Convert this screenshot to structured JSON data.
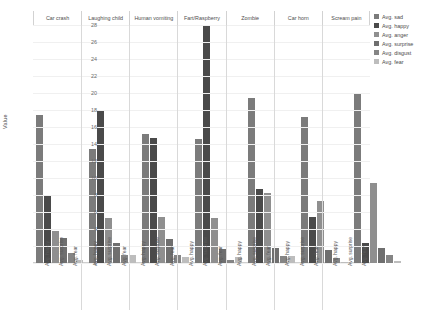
{
  "chart_data": {
    "type": "bar",
    "title": "",
    "xlabel": "",
    "ylabel": "Value",
    "ylim": [
      0,
      28
    ],
    "yticks": [
      28,
      26,
      24,
      22,
      20,
      18,
      16,
      14,
      12,
      10,
      8,
      6,
      4,
      2,
      0
    ],
    "grid": true,
    "legend_position": "right",
    "categories": [
      "Car crash",
      "Laughing child",
      "Human vomiting",
      "Fart/Raspberry",
      "Zombie",
      "Car horn",
      "Scream pain"
    ],
    "tick_labels": [
      "Avg. happy",
      "Avg. surprise",
      "Avg. fear"
    ],
    "series": [
      {
        "name": "Avg. sad",
        "color": "#7b7b7b",
        "values": [
          17.4,
          13.4,
          15.2,
          14.6,
          19.4,
          17.2,
          19.9
        ]
      },
      {
        "name": "Avg. happy",
        "color": "#4a4a4a",
        "values": [
          8.0,
          18.0,
          14.7,
          28.0,
          8.7,
          5.4,
          2.35
        ]
      },
      {
        "name": "Avg. anger",
        "color": "#8f8f8f",
        "values": [
          3.8,
          5.3,
          5.4,
          5.35,
          8.2,
          7.35,
          9.4
        ]
      },
      {
        "name": "Avg. surprise",
        "color": "#6f6f6f",
        "values": [
          3.0,
          2.4,
          2.8,
          1.6,
          1.8,
          1.5,
          1.8
        ]
      },
      {
        "name": "Avg. disgust",
        "color": "#858585",
        "values": [
          1.2,
          1.0,
          1.0,
          0.3,
          0.8,
          0.55,
          1.0
        ]
      },
      {
        "name": "Avg. fear",
        "color": "#bdbdbd",
        "values": [
          0.4,
          0.9,
          0.7,
          0.7,
          0.85,
          0.05,
          0.2
        ]
      }
    ]
  }
}
